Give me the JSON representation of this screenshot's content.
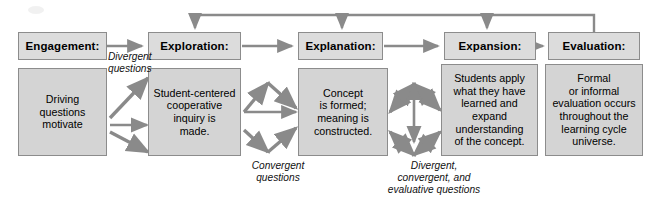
{
  "diagram": {
    "colors": {
      "header_fill": "#dcdcdc",
      "body_fill": "#d4d4d4",
      "border": "#8c8c8c",
      "arrow": "#8a8a8a",
      "text": "#000000",
      "background": "#ffffff"
    },
    "phases": [
      {
        "key": "engagement",
        "header": "Engagement:",
        "body": "Driving\nquestions\nmotivate"
      },
      {
        "key": "exploration",
        "header": "Exploration:",
        "body": "Student-centered\ncooperative\ninquiry is\nmade."
      },
      {
        "key": "explanation",
        "header": "Explanation:",
        "body": "Concept\nis formed;\nmeaning is\nconstructed."
      },
      {
        "key": "expansion",
        "header": "Expansion:",
        "body": "Students apply\nwhat they have\nlearned and\nexpand\nunderstanding\nof the concept."
      },
      {
        "key": "evaluation",
        "header": "Evaluation:",
        "body": "Formal\nor informal\nevaluation occurs\nthroughout the\nlearning cycle\nuniverse."
      }
    ],
    "edge_labels": [
      {
        "key": "divergent",
        "text": "Divergent\nquestions"
      },
      {
        "key": "convergent",
        "text": "Convergent\nquestions"
      },
      {
        "key": "divergent-convergent-evaluative",
        "text": "Divergent,\nconvergent, and\nevaluative questions"
      }
    ]
  }
}
